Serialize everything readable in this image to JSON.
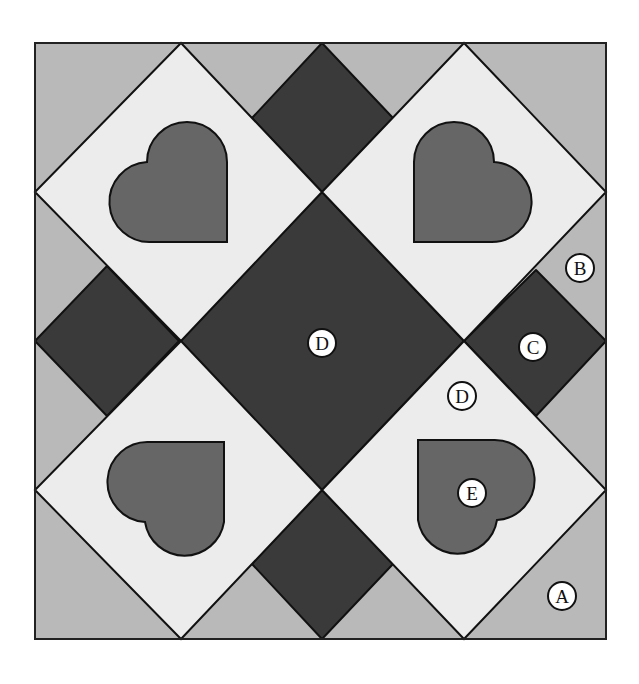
{
  "colors": {
    "background": "#ffffff",
    "light_gray_A_B": "#b9b9b9",
    "dark_C_center": "#3a3a3a",
    "light_D": "#ececec",
    "heart_E": "#666666",
    "outline": "#111111",
    "label_fill": "#ffffff"
  },
  "labels": [
    {
      "id": "A",
      "text": "A",
      "x": 562,
      "y": 596
    },
    {
      "id": "B",
      "text": "B",
      "x": 580,
      "y": 268
    },
    {
      "id": "C",
      "text": "C",
      "x": 533,
      "y": 347
    },
    {
      "id": "D_center",
      "text": "D",
      "x": 322,
      "y": 343
    },
    {
      "id": "D_light",
      "text": "D",
      "x": 462,
      "y": 396
    },
    {
      "id": "E",
      "text": "E",
      "x": 472,
      "y": 493
    }
  ]
}
